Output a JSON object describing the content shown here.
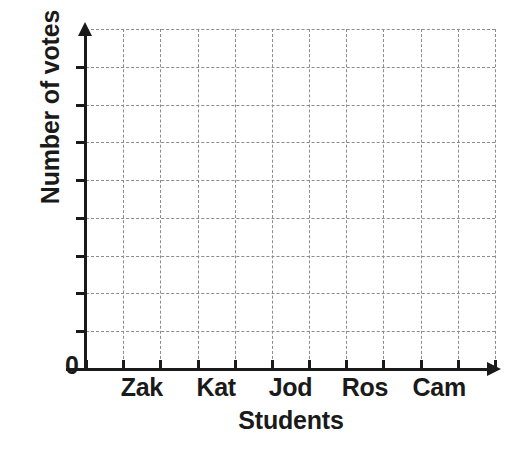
{
  "chart_data": {
    "type": "bar",
    "title": "",
    "subtitle": "",
    "xlabel": "Students",
    "ylabel": "Number of votes",
    "categories": [
      "Zak",
      "Kat",
      "Jod",
      "Ros",
      "Cam"
    ],
    "values": [
      null,
      null,
      null,
      null,
      null
    ],
    "series": [
      {
        "name": "Number of votes",
        "values": [
          null,
          null,
          null,
          null,
          null
        ]
      }
    ],
    "origin_label": "0",
    "ylim": [
      0,
      9
    ],
    "y_tick_labels": [
      "0",
      "",
      "",
      "",
      "",
      "",
      "",
      "",
      ""
    ],
    "y_tick_count": 9,
    "x_tick_count": 11,
    "grid": true,
    "grid_style": "dashed",
    "grid_rows": 9,
    "grid_columns": 11,
    "legend": false,
    "legend_position": "none",
    "colors": {
      "axis": "#1a1a1a",
      "grid": "#8c8c8c",
      "background": "#ffffff",
      "text": "#1a1a1a"
    }
  }
}
